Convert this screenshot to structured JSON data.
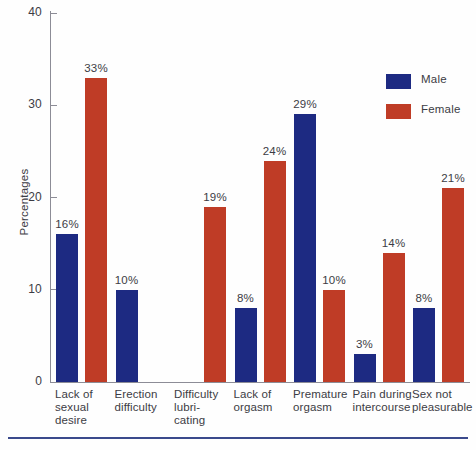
{
  "chart_data": {
    "type": "bar",
    "title": "",
    "xlabel": "",
    "ylabel": "Percentages",
    "ylim": [
      0,
      40
    ],
    "yticks": [
      0,
      10,
      20,
      30,
      40
    ],
    "grid": false,
    "legend_position": "top-right",
    "categories": [
      "Lack of\nsexual\ndesire",
      "Erection\ndifficulty",
      "Difficulty\nlubri-\ncating",
      "Lack of\norgasm",
      "Premature\norgasm",
      "Pain during\nintercourse",
      "Sex not\npleasurable"
    ],
    "series": [
      {
        "name": "Male",
        "color": "#1d2a82",
        "values": [
          16,
          10,
          null,
          8,
          29,
          3,
          8
        ],
        "labels": [
          "16%",
          "10%",
          "",
          "8%",
          "29%",
          "3%",
          "8%"
        ]
      },
      {
        "name": "Female",
        "color": "#bf3c26",
        "values": [
          33,
          null,
          19,
          24,
          10,
          14,
          21
        ],
        "labels": [
          "33%",
          "",
          "19%",
          "24%",
          "10%",
          "14%",
          "21%"
        ]
      }
    ]
  },
  "axis": {
    "y_title": "Percentages",
    "tick_labels": [
      "40",
      "30",
      "20",
      "10",
      "0"
    ]
  },
  "legend": {
    "items": [
      {
        "label": "Male",
        "color": "#1d2a82"
      },
      {
        "label": "Female",
        "color": "#bf3c26"
      }
    ]
  },
  "colors": {
    "male": "#1d2a82",
    "female": "#bf3c26",
    "axis": "#8c8c96",
    "text": "#3c3c44",
    "rule": "#3a4a8c",
    "background": "#fefefe"
  }
}
